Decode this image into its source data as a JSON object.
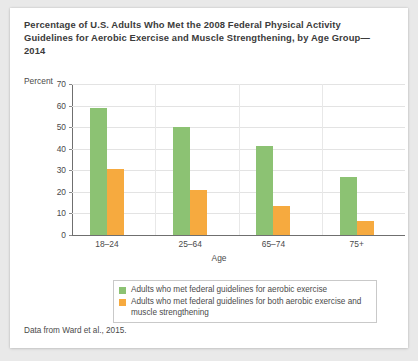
{
  "chart_data": {
    "type": "bar",
    "title": "Percentage of U.S. Adults Who Met the 2008 Federal Physical Activity Guidelines for Aerobic Exercise and Muscle Strengthening, by Age Group—2014",
    "xlabel": "Age",
    "ylabel": "Percent",
    "ylim": [
      0,
      70
    ],
    "yticks": [
      0,
      10,
      20,
      30,
      40,
      50,
      60,
      70
    ],
    "grid": true,
    "legend_position": "below-plot",
    "categories": [
      "18–24",
      "25–64",
      "65–74",
      "75+"
    ],
    "series": [
      {
        "name": "Adults who met federal guidelines for aerobic exercise",
        "color": "#8cc273",
        "values": [
          59.0,
          50.2,
          41.3,
          26.8
        ]
      },
      {
        "name": "Adults who met federal guidelines for both aerobic exercise and muscle strengthening",
        "color": "#f6aa3f",
        "values": [
          30.8,
          21.0,
          13.5,
          6.6
        ]
      }
    ],
    "source_note": "Data from Ward et al., 2015."
  },
  "legend": {
    "items": [
      {
        "label": "Adults who met federal guidelines for aerobic exercise"
      },
      {
        "label": "Adults who met federal guidelines for both aerobic exercise and muscle strengthening"
      }
    ]
  }
}
